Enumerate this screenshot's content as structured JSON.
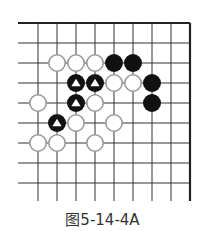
{
  "figure": {
    "caption": "图5-14-4A",
    "type": "go-board-diagram"
  },
  "board": {
    "columns": 9,
    "rows": 9,
    "origin_x": 38,
    "origin_y": 23,
    "col_spacing": 19,
    "row_spacing": 20,
    "line_left_extent": 18,
    "line_bottom_extent": 201,
    "edges": {
      "top": true,
      "right": true,
      "left": false,
      "bottom": false
    },
    "line_color": "#333333",
    "edge_color": "#222222",
    "stone_radius": 9
  },
  "colors": {
    "black_stone": "#111111",
    "white_stone_fill": "#ffffff",
    "white_stone_outline": "#9a9a9a",
    "triangle_mark": "#ffffff"
  },
  "stones": [
    {
      "color": "white",
      "col": 1,
      "row": 2,
      "marked": false
    },
    {
      "color": "white",
      "col": 2,
      "row": 2,
      "marked": false
    },
    {
      "color": "white",
      "col": 3,
      "row": 2,
      "marked": false
    },
    {
      "color": "black",
      "col": 4,
      "row": 2,
      "marked": false
    },
    {
      "color": "black",
      "col": 5,
      "row": 2,
      "marked": false
    },
    {
      "color": "black",
      "col": 2,
      "row": 3,
      "marked": true
    },
    {
      "color": "black",
      "col": 3,
      "row": 3,
      "marked": true
    },
    {
      "color": "white",
      "col": 4,
      "row": 3,
      "marked": false
    },
    {
      "color": "white",
      "col": 5,
      "row": 3,
      "marked": false
    },
    {
      "color": "black",
      "col": 6,
      "row": 3,
      "marked": false
    },
    {
      "color": "white",
      "col": 0,
      "row": 4,
      "marked": false
    },
    {
      "color": "black",
      "col": 2,
      "row": 4,
      "marked": true
    },
    {
      "color": "white",
      "col": 3,
      "row": 4,
      "marked": false
    },
    {
      "color": "black",
      "col": 6,
      "row": 4,
      "marked": false
    },
    {
      "color": "black",
      "col": 1,
      "row": 5,
      "marked": true
    },
    {
      "color": "white",
      "col": 2,
      "row": 5,
      "marked": false
    },
    {
      "color": "white",
      "col": 4,
      "row": 5,
      "marked": false
    },
    {
      "color": "white",
      "col": 0,
      "row": 6,
      "marked": false
    },
    {
      "color": "white",
      "col": 1,
      "row": 6,
      "marked": false
    },
    {
      "color": "white",
      "col": 3,
      "row": 6,
      "marked": false
    }
  ]
}
